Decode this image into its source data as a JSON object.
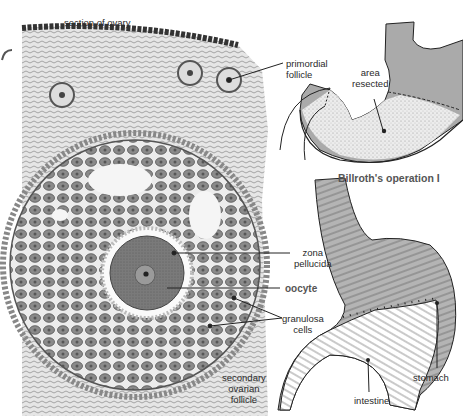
{
  "figure": {
    "left_panel": {
      "name": "ovary-section",
      "labels": {
        "section_of_ovary": "section of ovary",
        "primordial_follicle": "primordial\nfollicle",
        "zona_pellucida": "zona\npellucida",
        "oocyte": "oocyte",
        "granulosa_cells": "granulosa\ncells",
        "secondary_ovarian_follicle": "secondary\novarian\nfollicle"
      }
    },
    "right_top_panel": {
      "name": "stomach-resection",
      "labels": {
        "area_resected": "area\nresected"
      },
      "caption": "Billroth's operation I"
    },
    "right_bottom_panel": {
      "name": "stomach-anastomosis",
      "labels": {
        "stomach": "stomach",
        "intestine": "intestine"
      }
    }
  },
  "colors": {
    "tissue_dark": "#6a6a6a",
    "tissue_light": "#d8d8d8",
    "stomach_gray": "#a8a8a8",
    "resected_stipple": "#e2e2e2",
    "line": "#222222"
  }
}
